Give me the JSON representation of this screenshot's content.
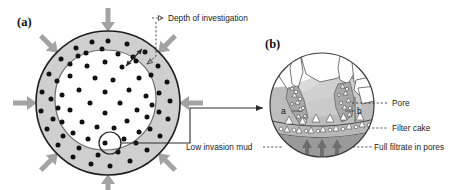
{
  "figure": {
    "panels": [
      {
        "id": "a",
        "label": "(a)",
        "caption": "Borehole cross-section with invaded zone"
      },
      {
        "id": "b",
        "label": "(b)",
        "caption": "Magnified pore-scale detail of filter cake"
      }
    ]
  },
  "annotations": {
    "depth_of_investigation": "Depth of investigation",
    "pore": "Pore",
    "filter_cake": "Filter cake",
    "low_invasion_mud": "Low invasion mud",
    "full_filtrate_in_pores": "Full filtrate in pores",
    "point_a": "a",
    "point_b": "b"
  },
  "colors": {
    "invaded_zone_gray": "#cfcfcf",
    "virgin_zone_white": "#ffffff",
    "arrow_gray": "#a3a3a3",
    "mud_dark_gray": "#9a9a9a",
    "filtrate_gray": "#bdbdbd",
    "shadow_gray": "#d2d2d2",
    "outline_black": "#1e1e1e",
    "text_black": "#1b1b1b"
  },
  "panel_a": {
    "outer_circle": {
      "cx": 108,
      "cy": 103,
      "r": 72
    },
    "inner_boundary": {
      "cx": 105,
      "cy": 100,
      "r": 50
    },
    "callout_circle": {
      "cx": 110,
      "cy": 143,
      "r": 11
    },
    "depth_arrow": {
      "x1": 130,
      "y1": 62,
      "x2": 143,
      "y2": 49
    },
    "dot_count_outer": 34,
    "dot_count_inner": 36,
    "inward_arrow_count": 8
  },
  "panel_b": {
    "circle": {
      "cx": 322,
      "cy": 105,
      "r": 52
    },
    "upward_arrow_count": 3,
    "regions": [
      "rock grains",
      "pore filtrate",
      "filter cake",
      "mud column"
    ]
  }
}
